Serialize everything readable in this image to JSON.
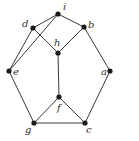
{
  "graph": {
    "nodes": [
      {
        "id": "i",
        "label": "i",
        "x": 58,
        "y": 14,
        "lx": 63,
        "ly": 10
      },
      {
        "id": "d",
        "label": "d",
        "x": 33,
        "y": 28,
        "lx": 22,
        "ly": 27
      },
      {
        "id": "b",
        "label": "b",
        "x": 84,
        "y": 27,
        "lx": 88,
        "ly": 28
      },
      {
        "id": "h",
        "label": "h",
        "x": 58,
        "y": 53,
        "lx": 54,
        "ly": 46
      },
      {
        "id": "e",
        "label": "e",
        "x": 9,
        "y": 71,
        "lx": 13,
        "ly": 75
      },
      {
        "id": "a",
        "label": "a",
        "x": 110,
        "y": 71,
        "lx": 101,
        "ly": 75
      },
      {
        "id": "f",
        "label": "f",
        "x": 59,
        "y": 97,
        "lx": 57,
        "ly": 111
      },
      {
        "id": "g",
        "label": "g",
        "x": 34,
        "y": 123,
        "lx": 25,
        "ly": 133
      },
      {
        "id": "c",
        "label": "c",
        "x": 85,
        "y": 123,
        "lx": 86,
        "ly": 133
      }
    ],
    "edges": [
      [
        "i",
        "d"
      ],
      [
        "i",
        "b"
      ],
      [
        "i",
        "e"
      ],
      [
        "d",
        "e"
      ],
      [
        "d",
        "h"
      ],
      [
        "b",
        "h"
      ],
      [
        "h",
        "f"
      ],
      [
        "b",
        "a"
      ],
      [
        "e",
        "g"
      ],
      [
        "a",
        "c"
      ],
      [
        "f",
        "g"
      ],
      [
        "f",
        "c"
      ],
      [
        "g",
        "c"
      ]
    ],
    "colors": {
      "edge": "#3a3a3a",
      "node": "#1a1a1a",
      "label": "#333333"
    }
  }
}
